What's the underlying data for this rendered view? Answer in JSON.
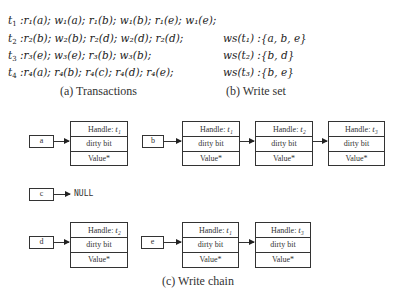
{
  "transactions": {
    "lines": [
      {
        "t": "t",
        "ti": "1",
        "ops": ":r₁(a); w₁(a); r₁(b); w₁(b); r₁(e); w₁(e);"
      },
      {
        "t": "t",
        "ti": "2",
        "ops": ":r₂(b); w₂(b); r₂(d); w₂(d); r₂(d);"
      },
      {
        "t": "t",
        "ti": "3",
        "ops": ":r₃(e); w₃(e); r₃(b); w₃(b);"
      },
      {
        "t": "t",
        "ti": "4",
        "ops": ":r₄(a); r₄(b); r₄(c); r₄(d); r₄(e);"
      }
    ],
    "caption": "(a) Transactions"
  },
  "write_set": {
    "lines": [
      {
        "label": "ws(t₁) :{a, b, e}"
      },
      {
        "label": "ws(t₂) :{b, d}"
      },
      {
        "label": "ws(t₃) :{b, e}"
      }
    ],
    "caption": "(b) Write set"
  },
  "write_chain": {
    "caption": "(c) Write chain",
    "row_labels": {
      "handle": "Handle: ",
      "dirty": "dirty bit",
      "value": "Value*"
    },
    "null_label": "NULL",
    "keys": {
      "a": {
        "label": "a",
        "handles": [
          "t₁"
        ]
      },
      "b": {
        "label": "b",
        "handles": [
          "t₁",
          "t₂",
          "t₃"
        ]
      },
      "c": {
        "label": "c",
        "handles": []
      },
      "d": {
        "label": "d",
        "handles": [
          "t₂"
        ]
      },
      "e": {
        "label": "e",
        "handles": [
          "t₁",
          "t₃"
        ]
      }
    }
  }
}
